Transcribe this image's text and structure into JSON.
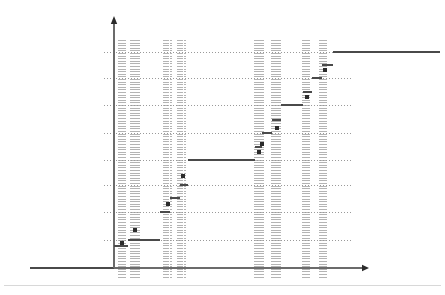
{
  "figure": {
    "kind": "step-function-plot",
    "background_color": "#ffffff",
    "axis_color": "#6b6b6b",
    "gridline_color": "#9a9a9a",
    "vertical_band_color": "#b4b4b4",
    "step_color": "#4a4a4a",
    "marker_color": "#2b2b2b",
    "footer_rule_color": "#d8d8d8",
    "title": "",
    "xlabel": "",
    "ylabel": ""
  },
  "axes": {
    "origin_x": 114,
    "origin_y": 268,
    "y_axis_top": 16,
    "x_axis_right": 362,
    "y_axis_arrow": "arrow-up",
    "x_axis_arrow": "arrow-right",
    "x_extension_left_to": 30,
    "x_extension_left_color": "#4a4a4a"
  },
  "chart_data": {
    "type": "line",
    "title": "",
    "xlabel": "",
    "ylabel": "",
    "xlim": [
      114,
      362
    ],
    "ylim": [
      268,
      40
    ],
    "grid": true,
    "legend": false,
    "gridlines_y": [
      52,
      78,
      105,
      133,
      160,
      185,
      212,
      240
    ],
    "vertical_line_groups": [
      {
        "name": "group-1",
        "lines": [
          119,
          121,
          123,
          125
        ]
      },
      {
        "name": "group-2",
        "lines": [
          131,
          133,
          135,
          137,
          139
        ]
      },
      {
        "name": "group-3",
        "lines": [
          164,
          166,
          168,
          171
        ]
      },
      {
        "name": "group-4",
        "lines": [
          178,
          180,
          182,
          185
        ]
      },
      {
        "name": "group-5",
        "lines": [
          255,
          257,
          259,
          261,
          263
        ]
      },
      {
        "name": "group-6",
        "lines": [
          272,
          274,
          276,
          278,
          280
        ]
      },
      {
        "name": "group-7",
        "lines": [
          303,
          305,
          307,
          309
        ]
      },
      {
        "name": "group-8",
        "lines": [
          320,
          322,
          324,
          326
        ]
      }
    ],
    "steps": [
      {
        "x0": 114,
        "x1": 128,
        "y": 246
      },
      {
        "x0": 128,
        "x1": 160,
        "y": 240
      },
      {
        "x0": 160,
        "x1": 170,
        "y": 212
      },
      {
        "x0": 170,
        "x1": 180,
        "y": 198
      },
      {
        "x0": 180,
        "x1": 188,
        "y": 185
      },
      {
        "x0": 188,
        "x1": 255,
        "y": 160
      },
      {
        "x0": 255,
        "x1": 262,
        "y": 147
      },
      {
        "x0": 262,
        "x1": 272,
        "y": 133
      },
      {
        "x0": 272,
        "x1": 281,
        "y": 120
      },
      {
        "x0": 281,
        "x1": 303,
        "y": 105
      },
      {
        "x0": 303,
        "x1": 312,
        "y": 92
      },
      {
        "x0": 312,
        "x1": 322,
        "y": 78
      },
      {
        "x0": 322,
        "x1": 333,
        "y": 65
      },
      {
        "x0": 333,
        "x1": 440,
        "y": 52
      }
    ],
    "markers": [
      {
        "x": 122,
        "y": 243
      },
      {
        "x": 135,
        "y": 230
      },
      {
        "x": 168,
        "y": 204
      },
      {
        "x": 183,
        "y": 176
      },
      {
        "x": 259,
        "y": 152
      },
      {
        "x": 262,
        "y": 144
      },
      {
        "x": 277,
        "y": 128
      },
      {
        "x": 307,
        "y": 97
      },
      {
        "x": 325,
        "y": 70
      }
    ]
  }
}
